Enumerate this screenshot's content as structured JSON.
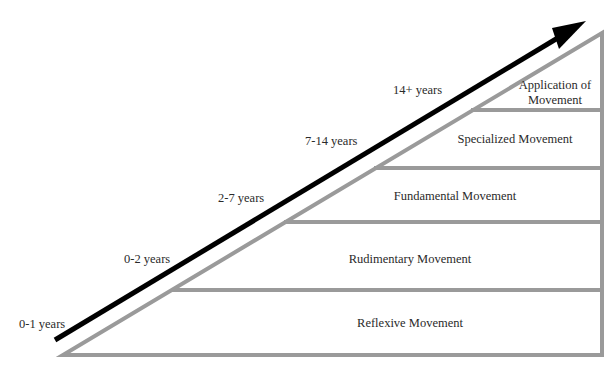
{
  "diagram": {
    "type": "stage-pyramid",
    "colors": {
      "pyramid_stroke": "#9a9a9a",
      "arrow": "#000000",
      "text": "#2a2a2a",
      "background": "#ffffff"
    },
    "stages": [
      {
        "label": "Reflexive Movement",
        "age": "0-1 years"
      },
      {
        "label": "Rudimentary Movement",
        "age": "0-2 years"
      },
      {
        "label": "Fundamental Movement",
        "age": "2-7 years"
      },
      {
        "label": "Specialized Movement",
        "age": "7-14 years"
      },
      {
        "label": "Application of Movement",
        "label_line1": "Application of",
        "label_line2": "Movement",
        "age": "14+ years"
      }
    ]
  }
}
